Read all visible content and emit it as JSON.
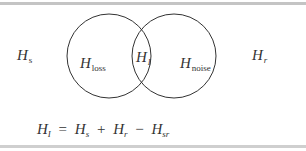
{
  "diagram": {
    "type": "venn",
    "outside_left": {
      "symbol": "H",
      "subscript": "s"
    },
    "outside_right": {
      "symbol": "H",
      "subscript": "r"
    },
    "circles": [
      {
        "name": "left",
        "region_label": {
          "symbol": "H",
          "subscript": "loss"
        }
      },
      {
        "name": "right",
        "region_label": {
          "symbol": "H",
          "subscript": "noise"
        }
      }
    ],
    "intersection": {
      "symbol": "H",
      "subscript": "I"
    },
    "equation": {
      "lhs": {
        "symbol": "H",
        "subscript": "I"
      },
      "equals": "=",
      "terms": [
        {
          "symbol": "H",
          "subscript": "s"
        },
        {
          "op": "+"
        },
        {
          "symbol": "H",
          "subscript": "r"
        },
        {
          "op": "−"
        },
        {
          "symbol": "H",
          "subscript": "sr"
        }
      ]
    },
    "colors": {
      "stroke": "#333333",
      "text": "#333333",
      "rule": "#c4c4c4"
    }
  }
}
